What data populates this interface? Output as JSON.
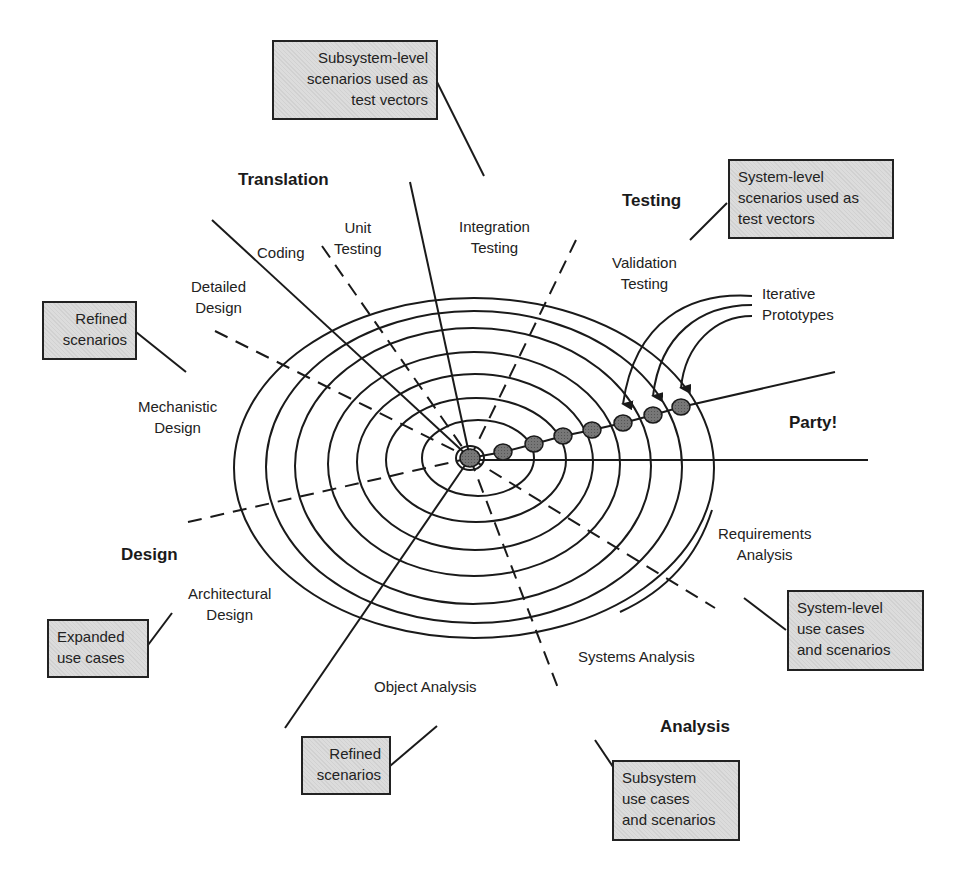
{
  "phases": {
    "translation": "Translation",
    "testing": "Testing",
    "design": "Design",
    "analysis": "Analysis",
    "party": "Party!"
  },
  "activities": {
    "coding": "Coding",
    "unit_testing": [
      "Unit",
      "Testing"
    ],
    "integration_testing": [
      "Integration",
      "Testing"
    ],
    "validation_testing": [
      "Validation",
      "Testing"
    ],
    "detailed_design": [
      "Detailed",
      "Design"
    ],
    "mechanistic_design": [
      "Mechanistic",
      "Design"
    ],
    "architectural_design": [
      "Architectural",
      "Design"
    ],
    "object_analysis": "Object Analysis",
    "systems_analysis": "Systems Analysis",
    "requirements_analysis": [
      "Requirements",
      "Analysis"
    ],
    "iterative_prototypes": [
      "Iterative",
      "Prototypes"
    ]
  },
  "callouts": {
    "subsystem_test_vectors": [
      "Subsystem-level",
      "scenarios used as",
      "test vectors"
    ],
    "system_test_vectors": [
      "System-level",
      "scenarios used as",
      "test vectors"
    ],
    "refined_scenarios_design": [
      "Refined",
      "scenarios"
    ],
    "expanded_use_cases": [
      "Expanded",
      "use cases"
    ],
    "system_use_cases": [
      "System-level",
      "use cases",
      "and scenarios"
    ],
    "refined_scenarios_analysis": [
      "Refined",
      "scenarios"
    ],
    "subsystem_use_cases": [
      "Subsystem",
      "use cases",
      "and scenarios"
    ]
  },
  "colors": {
    "ink": "#1a1a1a",
    "callout_fill": "#dcdcdc",
    "dot_fill": "#6a6a6a"
  },
  "prototype_count": 7
}
